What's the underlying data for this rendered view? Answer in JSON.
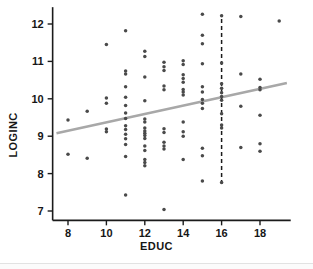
{
  "figure": {
    "type": "scatter-plot",
    "background": "#ffffff"
  },
  "labels": {
    "x_axis_title": "EDUC",
    "y_axis_title": "LOGINC"
  },
  "style": {
    "point_color": "#4a4a4a",
    "fit_line_color": "#a8a8a8",
    "reference_line_color": "#1b1b1b",
    "axis_color": "#1b1b1b",
    "tick_label_color": "#161616"
  },
  "chart_data": {
    "type": "scatter",
    "title": "",
    "xlabel": "EDUC",
    "ylabel": "LOGINC",
    "xlim": [
      7.2,
      19.6
    ],
    "ylim": [
      6.75,
      12.45
    ],
    "xticks": [
      8,
      10,
      12,
      14,
      16,
      18
    ],
    "yticks": [
      7,
      8,
      9,
      10,
      11,
      12
    ],
    "xtick_labels": [
      "8",
      "10",
      "12",
      "14",
      "16",
      "18"
    ],
    "ytick_labels": [
      "7",
      "8",
      "9",
      "10",
      "11",
      "12"
    ],
    "grid": false,
    "legend": null,
    "series": [
      {
        "name": "observations",
        "marker": "circle",
        "color": "#4a4a4a",
        "points": [
          [
            8,
            9.43
          ],
          [
            8,
            8.52
          ],
          [
            9,
            9.67
          ],
          [
            9,
            8.41
          ],
          [
            10,
            11.45
          ],
          [
            10,
            10.02
          ],
          [
            10,
            9.88
          ],
          [
            10,
            9.19
          ],
          [
            10,
            9.12
          ],
          [
            11,
            11.82
          ],
          [
            11,
            10.74
          ],
          [
            11,
            10.66
          ],
          [
            11,
            10.32
          ],
          [
            11,
            10.04
          ],
          [
            11,
            9.82
          ],
          [
            11,
            9.62
          ],
          [
            11,
            9.47
          ],
          [
            11,
            9.28
          ],
          [
            11,
            9.18
          ],
          [
            11,
            9.05
          ],
          [
            11,
            8.93
          ],
          [
            11,
            8.78
          ],
          [
            11,
            8.46
          ],
          [
            11,
            7.43
          ],
          [
            12,
            11.27
          ],
          [
            12,
            11.13
          ],
          [
            12,
            10.58
          ],
          [
            12,
            9.95
          ],
          [
            12,
            9.46
          ],
          [
            12,
            9.38
          ],
          [
            12,
            9.22
          ],
          [
            12,
            9.14
          ],
          [
            12,
            9.08
          ],
          [
            12,
            9.02
          ],
          [
            12,
            8.94
          ],
          [
            12,
            8.74
          ],
          [
            12,
            8.62
          ],
          [
            12,
            8.38
          ],
          [
            12,
            8.3
          ],
          [
            12,
            8.21
          ],
          [
            13,
            10.98
          ],
          [
            13,
            10.86
          ],
          [
            13,
            10.76
          ],
          [
            13,
            10.34
          ],
          [
            13,
            10.24
          ],
          [
            13,
            9.2
          ],
          [
            13,
            9.1
          ],
          [
            13,
            8.84
          ],
          [
            13,
            8.74
          ],
          [
            13,
            8.66
          ],
          [
            13,
            7.04
          ],
          [
            14,
            11.02
          ],
          [
            14,
            10.92
          ],
          [
            14,
            10.64
          ],
          [
            14,
            10.54
          ],
          [
            14,
            10.44
          ],
          [
            14,
            10.25
          ],
          [
            14,
            10.18
          ],
          [
            14,
            10.1
          ],
          [
            14,
            9.38
          ],
          [
            14,
            9.12
          ],
          [
            14,
            9.0
          ],
          [
            14,
            8.38
          ],
          [
            15,
            12.26
          ],
          [
            15,
            11.7
          ],
          [
            15,
            11.47
          ],
          [
            15,
            10.94
          ],
          [
            15,
            10.32
          ],
          [
            15,
            10.18
          ],
          [
            15,
            9.98
          ],
          [
            15,
            9.88
          ],
          [
            15,
            9.74
          ],
          [
            15,
            8.68
          ],
          [
            15,
            8.48
          ],
          [
            15,
            7.8
          ],
          [
            16,
            12.22
          ],
          [
            16,
            10.96
          ],
          [
            16,
            10.4
          ],
          [
            16,
            10.28
          ],
          [
            16,
            10.16
          ],
          [
            16,
            10.06
          ],
          [
            16,
            9.96
          ],
          [
            16,
            9.6
          ],
          [
            16,
            9.3
          ],
          [
            16,
            9.22
          ],
          [
            16,
            7.76
          ],
          [
            17,
            12.2
          ],
          [
            17,
            10.66
          ],
          [
            17,
            9.8
          ],
          [
            17,
            8.7
          ],
          [
            18,
            10.52
          ],
          [
            18,
            10.3
          ],
          [
            18,
            10.24
          ],
          [
            18,
            9.56
          ],
          [
            18,
            8.8
          ],
          [
            18,
            8.6
          ],
          [
            19,
            12.08
          ]
        ]
      }
    ],
    "fit_line": {
      "name": "linear-fit",
      "color": "#a8a8a8",
      "x_start": 7.4,
      "y_start": 9.08,
      "x_end": 19.4,
      "y_end": 10.42,
      "slope": 0.112,
      "intercept": 8.25
    },
    "reference_line": {
      "name": "vertical-reference-at-educ-16",
      "orientation": "vertical",
      "x": 16,
      "y_start": 7.72,
      "y_end": 12.25,
      "style": "dashed",
      "color": "#1b1b1b"
    }
  }
}
